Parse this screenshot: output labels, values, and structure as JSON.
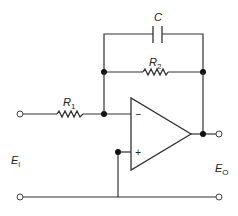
{
  "diagram": {
    "type": "circuit-schematic",
    "colors": {
      "line": "#333333",
      "background": "#ffffff"
    },
    "components": {
      "capacitor": {
        "label": "C"
      },
      "feedback_resistor": {
        "label": "R",
        "subscript": "2"
      },
      "input_resistor": {
        "label": "R",
        "subscript": "1"
      },
      "opamp": {
        "inverting_sign": "−",
        "noninverting_sign": "+"
      }
    },
    "terminals": {
      "input": {
        "label": "E",
        "subscript": "I"
      },
      "output": {
        "label": "E",
        "subscript": "O"
      }
    }
  }
}
